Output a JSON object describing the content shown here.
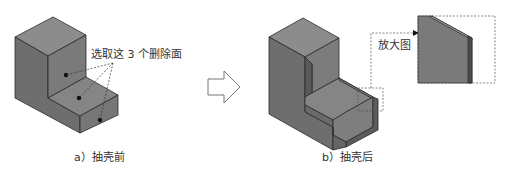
{
  "figure": {
    "left_panel": {
      "caption": "a）抽壳前",
      "annotation": "选取这 3 个删除面",
      "marked_faces": 3
    },
    "transition_arrow": "right-arrow",
    "right_panel": {
      "caption": "b）抽壳后",
      "callout_label": "放大图"
    },
    "colors": {
      "solid_top": "#8a8a8a",
      "solid_left": "#6f6f6f",
      "solid_right": "#7a7a7a",
      "edge": "#2a2a2a",
      "dashed": "#555555",
      "background": "#ffffff"
    }
  }
}
